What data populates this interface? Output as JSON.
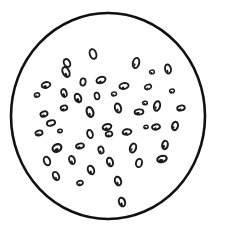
{
  "figure": {
    "kind": "micrograph-schematic",
    "canvas": {
      "width": 226,
      "height": 236
    },
    "background_color": "#ffffff",
    "ink_color": "#1a1a1a"
  },
  "field": {
    "shape": "circle",
    "center_x": 108,
    "center_y": 116,
    "radius_x": 97,
    "radius_y": 103,
    "stroke_color": "#111111",
    "stroke_width": 2.6,
    "fill_color": "#ffffff",
    "label": "field-of-view-boundary"
  },
  "cells": {
    "count": 50,
    "outline_color": "#1a1a1a",
    "fill_color": "#ffffff",
    "nucleus_color": "#1a1a1a",
    "items": [
      {
        "id": 1,
        "cx": 93,
        "cy": 54,
        "rx": 3.2,
        "ry": 5.0,
        "rot": -18,
        "sw": 1.9,
        "nucleus": 0.0
      },
      {
        "id": 2,
        "cx": 67,
        "cy": 63,
        "rx": 3.0,
        "ry": 4.2,
        "rot": -28,
        "sw": 1.9,
        "nucleus": 0.0
      },
      {
        "id": 3,
        "cx": 66,
        "cy": 72,
        "rx": 3.2,
        "ry": 5.2,
        "rot": -26,
        "sw": 2.0,
        "nucleus": 0.35
      },
      {
        "id": 4,
        "cx": 136,
        "cy": 63,
        "rx": 3.1,
        "ry": 5.2,
        "rot": 14,
        "sw": 2.0,
        "nucleus": 0.3
      },
      {
        "id": 5,
        "cx": 168,
        "cy": 69,
        "rx": 2.9,
        "ry": 4.6,
        "rot": -12,
        "sw": 1.9,
        "nucleus": 0.3
      },
      {
        "id": 6,
        "cx": 46,
        "cy": 85,
        "rx": 4.4,
        "ry": 2.8,
        "rot": -14,
        "sw": 1.9,
        "nucleus": 0.4
      },
      {
        "id": 7,
        "cx": 83,
        "cy": 82,
        "rx": 2.6,
        "ry": 3.6,
        "rot": 8,
        "sw": 1.8,
        "nucleus": 0.0
      },
      {
        "id": 8,
        "cx": 101,
        "cy": 80,
        "rx": 4.6,
        "ry": 3.0,
        "rot": -20,
        "sw": 2.0,
        "nucleus": 0.35
      },
      {
        "id": 9,
        "cx": 124,
        "cy": 86,
        "rx": 4.6,
        "ry": 2.9,
        "rot": -12,
        "sw": 1.9,
        "nucleus": 0.3
      },
      {
        "id": 10,
        "cx": 148,
        "cy": 87,
        "rx": 3.4,
        "ry": 2.3,
        "rot": -18,
        "sw": 1.7,
        "nucleus": 0.3
      },
      {
        "id": 11,
        "cx": 64,
        "cy": 93,
        "rx": 2.6,
        "ry": 4.0,
        "rot": -22,
        "sw": 1.9,
        "nucleus": 0.4
      },
      {
        "id": 12,
        "cx": 78,
        "cy": 98,
        "rx": 3.0,
        "ry": 4.4,
        "rot": -24,
        "sw": 2.0,
        "nucleus": 0.45
      },
      {
        "id": 13,
        "cx": 157,
        "cy": 106,
        "rx": 3.0,
        "ry": 4.8,
        "rot": 14,
        "sw": 2.0,
        "nucleus": 0.3
      },
      {
        "id": 14,
        "cx": 44,
        "cy": 114,
        "rx": 3.6,
        "ry": 2.6,
        "rot": -22,
        "sw": 1.9,
        "nucleus": 0.4
      },
      {
        "id": 15,
        "cx": 90,
        "cy": 112,
        "rx": 3.2,
        "ry": 5.0,
        "rot": -20,
        "sw": 2.1,
        "nucleus": 0.3
      },
      {
        "id": 16,
        "cx": 118,
        "cy": 108,
        "rx": 3.0,
        "ry": 4.6,
        "rot": -16,
        "sw": 2.0,
        "nucleus": 0.3
      },
      {
        "id": 17,
        "cx": 139,
        "cy": 112,
        "rx": 4.4,
        "ry": 2.6,
        "rot": -6,
        "sw": 1.9,
        "nucleus": 0.45
      },
      {
        "id": 18,
        "cx": 107,
        "cy": 127,
        "rx": 4.4,
        "ry": 2.8,
        "rot": -16,
        "sw": 2.0,
        "nucleus": 0.4
      },
      {
        "id": 19,
        "cx": 156,
        "cy": 127,
        "rx": 4.0,
        "ry": 2.6,
        "rot": -12,
        "sw": 1.9,
        "nucleus": 0.35
      },
      {
        "id": 20,
        "cx": 175,
        "cy": 126,
        "rx": 2.9,
        "ry": 4.2,
        "rot": 16,
        "sw": 2.0,
        "nucleus": 0.3
      },
      {
        "id": 21,
        "cx": 39,
        "cy": 133,
        "rx": 3.6,
        "ry": 2.5,
        "rot": -16,
        "sw": 1.8,
        "nucleus": 0.4
      },
      {
        "id": 22,
        "cx": 90,
        "cy": 134,
        "rx": 2.7,
        "ry": 4.2,
        "rot": -16,
        "sw": 1.9,
        "nucleus": 0.0
      },
      {
        "id": 23,
        "cx": 109,
        "cy": 134,
        "rx": 3.4,
        "ry": 2.5,
        "rot": -14,
        "sw": 1.8,
        "nucleus": 0.35
      },
      {
        "id": 24,
        "cx": 127,
        "cy": 132,
        "rx": 4.4,
        "ry": 2.7,
        "rot": -10,
        "sw": 2.0,
        "nucleus": 0.4
      },
      {
        "id": 25,
        "cx": 57,
        "cy": 148,
        "rx": 4.6,
        "ry": 3.6,
        "rot": -30,
        "sw": 2.2,
        "nucleus": 0.5
      },
      {
        "id": 26,
        "cx": 133,
        "cy": 148,
        "rx": 3.0,
        "ry": 4.6,
        "rot": 18,
        "sw": 2.0,
        "nucleus": 0.3
      },
      {
        "id": 27,
        "cx": 165,
        "cy": 145,
        "rx": 2.8,
        "ry": 4.2,
        "rot": 10,
        "sw": 2.0,
        "nucleus": 0.4
      },
      {
        "id": 28,
        "cx": 72,
        "cy": 160,
        "rx": 2.7,
        "ry": 4.2,
        "rot": -20,
        "sw": 1.9,
        "nucleus": 0.35
      },
      {
        "id": 29,
        "cx": 110,
        "cy": 162,
        "rx": 2.9,
        "ry": 4.4,
        "rot": -16,
        "sw": 2.0,
        "nucleus": 0.35
      },
      {
        "id": 30,
        "cx": 139,
        "cy": 163,
        "rx": 3.0,
        "ry": 4.2,
        "rot": 12,
        "sw": 1.9,
        "nucleus": 0.0
      },
      {
        "id": 31,
        "cx": 162,
        "cy": 159,
        "rx": 4.8,
        "ry": 3.0,
        "rot": -14,
        "sw": 2.1,
        "nucleus": 0.5
      },
      {
        "id": 32,
        "cx": 91,
        "cy": 170,
        "rx": 3.0,
        "ry": 4.4,
        "rot": -22,
        "sw": 2.0,
        "nucleus": 0.35
      },
      {
        "id": 33,
        "cx": 56,
        "cy": 176,
        "rx": 2.8,
        "ry": 4.4,
        "rot": -26,
        "sw": 1.9,
        "nucleus": 0.3
      },
      {
        "id": 34,
        "cx": 80,
        "cy": 183,
        "rx": 3.0,
        "ry": 2.2,
        "rot": -18,
        "sw": 1.7,
        "nucleus": 0.35
      },
      {
        "id": 35,
        "cx": 118,
        "cy": 181,
        "rx": 3.0,
        "ry": 4.4,
        "rot": -18,
        "sw": 2.0,
        "nucleus": 0.3
      },
      {
        "id": 36,
        "cx": 122,
        "cy": 202,
        "rx": 3.0,
        "ry": 4.4,
        "rot": -18,
        "sw": 2.0,
        "nucleus": 0.35
      },
      {
        "id": 37,
        "cx": 145,
        "cy": 103,
        "rx": 2.4,
        "ry": 1.8,
        "rot": -10,
        "sw": 1.5,
        "nucleus": 0.4
      },
      {
        "id": 38,
        "cx": 64,
        "cy": 108,
        "rx": 3.4,
        "ry": 2.4,
        "rot": -18,
        "sw": 1.8,
        "nucleus": 0.4
      },
      {
        "id": 39,
        "cx": 37,
        "cy": 95,
        "rx": 2.6,
        "ry": 2.0,
        "rot": -12,
        "sw": 1.6,
        "nucleus": 0.4
      },
      {
        "id": 40,
        "cx": 172,
        "cy": 91,
        "rx": 2.4,
        "ry": 1.9,
        "rot": -8,
        "sw": 1.5,
        "nucleus": 0.4
      },
      {
        "id": 41,
        "cx": 51,
        "cy": 123,
        "rx": 4.2,
        "ry": 2.6,
        "rot": -16,
        "sw": 1.9,
        "nucleus": 0.0
      },
      {
        "id": 42,
        "cx": 97,
        "cy": 96,
        "rx": 2.4,
        "ry": 3.4,
        "rot": -12,
        "sw": 1.7,
        "nucleus": 0.0
      },
      {
        "id": 43,
        "cx": 114,
        "cy": 94,
        "rx": 2.5,
        "ry": 1.9,
        "rot": -8,
        "sw": 1.5,
        "nucleus": 0.4
      },
      {
        "id": 44,
        "cx": 152,
        "cy": 72,
        "rx": 2.4,
        "ry": 1.9,
        "rot": -10,
        "sw": 1.5,
        "nucleus": 0.4
      },
      {
        "id": 45,
        "cx": 80,
        "cy": 146,
        "rx": 4.0,
        "ry": 2.5,
        "rot": -14,
        "sw": 1.9,
        "nucleus": 0.4
      },
      {
        "id": 46,
        "cx": 101,
        "cy": 150,
        "rx": 2.5,
        "ry": 3.6,
        "rot": -16,
        "sw": 1.8,
        "nucleus": 0.35
      },
      {
        "id": 47,
        "cx": 47,
        "cy": 161,
        "rx": 3.0,
        "ry": 4.4,
        "rot": -22,
        "sw": 1.9,
        "nucleus": 0.0
      },
      {
        "id": 48,
        "cx": 181,
        "cy": 108,
        "rx": 3.8,
        "ry": 2.5,
        "rot": -12,
        "sw": 1.9,
        "nucleus": 0.35
      },
      {
        "id": 49,
        "cx": 146,
        "cy": 127,
        "rx": 2.2,
        "ry": 1.7,
        "rot": -10,
        "sw": 1.4,
        "nucleus": 0.4
      },
      {
        "id": 50,
        "cx": 60,
        "cy": 131,
        "rx": 2.3,
        "ry": 1.8,
        "rot": -12,
        "sw": 1.5,
        "nucleus": 0.4
      }
    ]
  }
}
